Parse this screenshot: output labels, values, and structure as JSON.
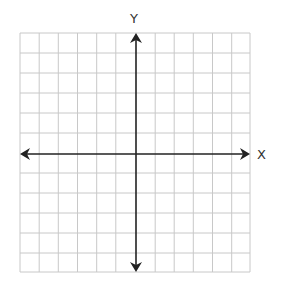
{
  "diagram": {
    "type": "coordinate-grid",
    "x_axis_label": "X",
    "y_axis_label": "Y",
    "columns": 12,
    "rows": 12,
    "grid_color": "#c8c8c8",
    "axis_color": "#222222"
  }
}
